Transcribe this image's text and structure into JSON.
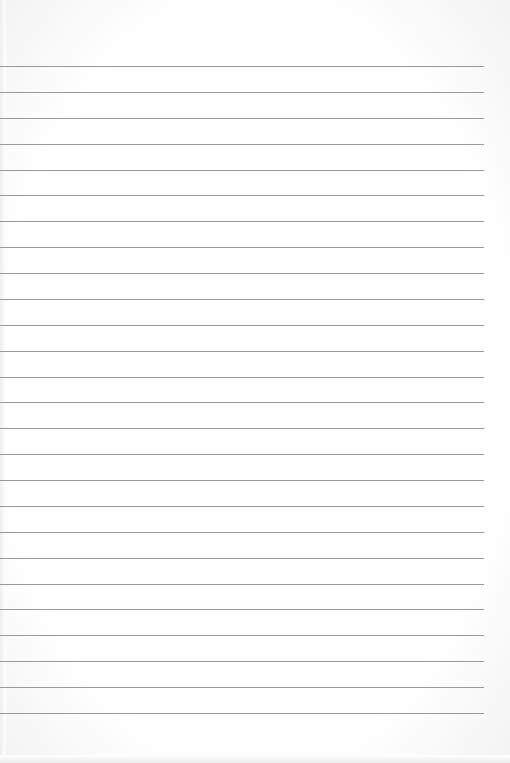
{
  "paper": {
    "type": "lined-paper",
    "background_color": "#ffffff",
    "line_color": "#9a9a9a",
    "line_count": 26,
    "first_line_y": 66,
    "line_spacing": 25.88,
    "line_left_x": 0,
    "line_right_x": 484
  }
}
